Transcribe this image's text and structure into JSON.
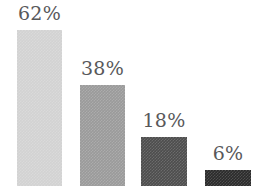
{
  "chart_data": {
    "type": "bar",
    "title": "",
    "subtitle": "",
    "xlabel": "",
    "ylabel": "",
    "categories": [
      "",
      "",
      "",
      ""
    ],
    "values": [
      62,
      38,
      18,
      6
    ],
    "value_labels": [
      "62%",
      "38%",
      "18%",
      "6%"
    ],
    "value_suffix": "%",
    "ylim": [
      0,
      70
    ],
    "grid": false,
    "legend": false,
    "legend_position": "none",
    "background_color": "#ffffff",
    "label_color": "#58585a",
    "bars": [
      {
        "label": "62%",
        "value": 62,
        "color": "#d2d2d2",
        "left_px": 17,
        "width_px": 45,
        "top_px": 30,
        "height_px": 156,
        "label_top_px": 4
      },
      {
        "label": "38%",
        "value": 38,
        "color": "#9a9a9a",
        "left_px": 80,
        "width_px": 45,
        "top_px": 85,
        "height_px": 101,
        "label_top_px": 59
      },
      {
        "label": "18%",
        "value": 18,
        "color": "#4d4d4d",
        "left_px": 141,
        "width_px": 46,
        "top_px": 137,
        "height_px": 49,
        "label_top_px": 111
      },
      {
        "label": "6%",
        "value": 6,
        "color": "#2b2b2b",
        "left_px": 205,
        "width_px": 46,
        "top_px": 170,
        "height_px": 16,
        "label_top_px": 144
      }
    ]
  }
}
